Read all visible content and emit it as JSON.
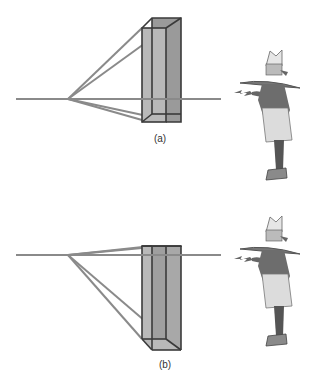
{
  "figure": {
    "panels": [
      {
        "id": "a",
        "label": "(a)",
        "label_x": 160,
        "label_y": 133,
        "horizon_y": 99,
        "vanishing_point_x": 68,
        "description": "Tall box viewed with horizon low on the box; box extends upward from near horizon"
      },
      {
        "id": "b",
        "label": "(b)",
        "label_x": 165,
        "label_y": 359,
        "horizon_y": 255,
        "vanishing_point_x": 68,
        "description": "Tall box viewed with horizon near top of the box; box extends downward"
      }
    ],
    "colors": {
      "line": "#8a8a8a",
      "box_front": "#b9b9b9",
      "box_side": "#9a9a9a",
      "box_edge": "#3a3a3a",
      "figure_dark": "#555555",
      "figure_light": "#d8d8d8"
    },
    "characters": [
      {
        "name": "wizard-figure-a",
        "description": "Observer character with wide-brim hat pointing toward the box"
      },
      {
        "name": "wizard-figure-b",
        "description": "Observer character with wide-brim hat pointing toward the box"
      }
    ]
  }
}
